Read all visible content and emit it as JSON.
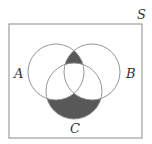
{
  "diagram": {
    "type": "venn",
    "universe_label": "S",
    "sets": [
      {
        "label": "A",
        "cx": 56,
        "cy": 72,
        "r": 28
      },
      {
        "label": "B",
        "cx": 92,
        "cy": 72,
        "r": 28
      },
      {
        "label": "C",
        "cx": 74,
        "cy": 91,
        "r": 28
      }
    ],
    "shaded_regions": [
      "A ∩ B − C",
      "C − (A ∪ B)"
    ],
    "colors": {
      "shade": "#585858",
      "stroke": "#8a8a8a",
      "frame": "#8a8a8a"
    }
  }
}
